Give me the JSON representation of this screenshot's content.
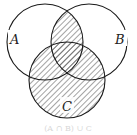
{
  "diagram": {
    "type": "venn",
    "sets": [
      {
        "id": "A",
        "label": "A"
      },
      {
        "id": "B",
        "label": "B"
      },
      {
        "id": "C",
        "label": "C"
      }
    ],
    "shaded_region": "(A ∩ B) ∪ C",
    "caption": "(A ∩ B) ∪ C",
    "colors": {
      "stroke": "#1a1a1a",
      "hatch": "#333333",
      "background": "#ffffff"
    }
  }
}
